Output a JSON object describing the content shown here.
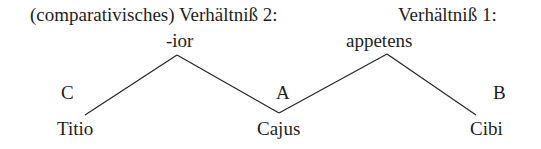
{
  "header": {
    "relation_2_label": "(comparativisches) Verhältniß 2:",
    "relation_1_label": "Verhältniß 1:"
  },
  "nodes": {
    "top_left": "-ior",
    "top_right": "appetens",
    "role_c": "C",
    "role_a": "A",
    "role_b": "B",
    "leaf_left": "Titio",
    "leaf_middle": "Cajus",
    "leaf_right": "Cibi"
  },
  "colors": {
    "ink": "#1e1e1e",
    "background": "#ffffff"
  }
}
